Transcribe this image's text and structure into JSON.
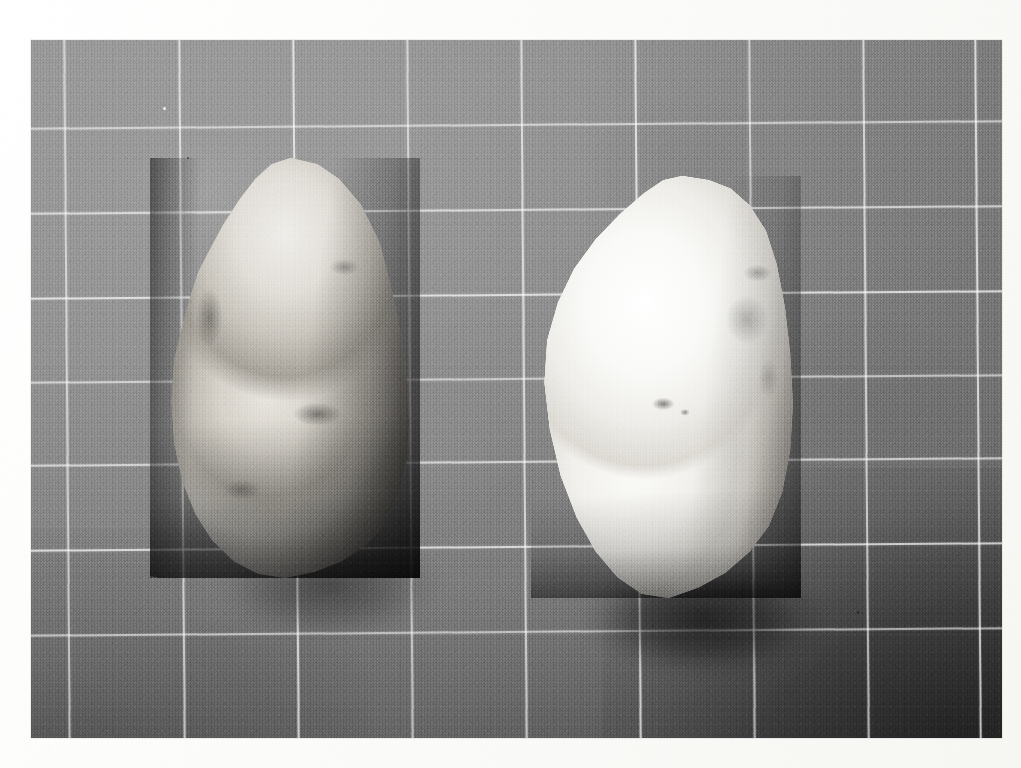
{
  "document": {
    "type": "black-and-white photographic plate",
    "subject": "Two lithic stone artifacts photographed on a gridded measuring board",
    "caption": "",
    "page_background": "#fdfdfb",
    "photo": {
      "x": 31,
      "y": 40,
      "width": 971,
      "height": 698,
      "tone": "monochrome silver gelatin print",
      "board_color": "#8e8e8e",
      "grid_line_color": "#ffffff",
      "grid_cell_width_px": 114,
      "grid_cell_height_px": 85,
      "grid_rotation_deg": -0.45,
      "vignette": "darkens toward bottom and right corners"
    },
    "objects": [
      {
        "name": "artifact-left",
        "label": "",
        "description": "Grey patinated flint tool, elongated oval, pointed toward top, darker cortex along right and lower margins",
        "color_light": "#e7e4de",
        "color_mid": "#b0aca4",
        "color_dark": "#57534f",
        "x": 150,
        "y": 158,
        "width": 270,
        "height": 420
      },
      {
        "name": "artifact-right",
        "label": "",
        "description": "Bright white chalky cortex flint tool, broad oval, slightly tilted, strong cast shadow at lower left",
        "color_light": "#ffffff",
        "color_mid": "#f2f1ed",
        "color_dark": "#7e7a74",
        "x": 531,
        "y": 176,
        "width": 270,
        "height": 422
      }
    ],
    "scale_grid": {
      "vertical_line_x": [
        66,
        181,
        295,
        409,
        523,
        637,
        751,
        865,
        977
      ],
      "horizontal_line_y": [
        124,
        209,
        294,
        378,
        461,
        546,
        631
      ]
    }
  }
}
